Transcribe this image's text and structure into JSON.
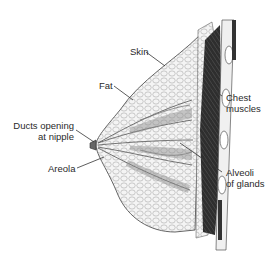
{
  "diagram": {
    "labels": {
      "skin": "Skin",
      "fat": "Fat",
      "chest_muscles_line1": "Chest",
      "chest_muscles_line2": "muscles",
      "ducts_line1": "Ducts opening",
      "ducts_line2": "at nipple",
      "areola": "Areola",
      "alveoli_line1": "Alveoli",
      "alveoli_line2": "of glands"
    },
    "colors": {
      "background": "#ffffff",
      "line": "#333333",
      "tissue_fill": "#f2f2f2",
      "muscle": "#2b2b2b",
      "text": "#2a2a2a"
    }
  }
}
